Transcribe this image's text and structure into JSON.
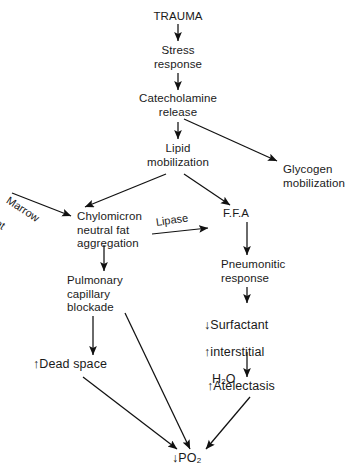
{
  "diagram": {
    "background_color": "#ffffff",
    "text_color": "#1a1a1a",
    "arrow_color": "#111111",
    "nodes": {
      "trauma": "TRAUMA",
      "stress_response": "Stress\nresponse",
      "catecholamine_release": "Catecholamine\nrelease",
      "lipid_mobilization": "Lipid\nmobilization",
      "glycogen_mobilization": "Glycogen\nmobilization",
      "chylomicron": "Chylomicron\nneutral fat\naggregation",
      "ffa": "F.F.A",
      "pulmonary_capillary_blockade": "Pulmonary\ncapillary\nblockade",
      "pneumonitic_response": "Pneumonitic\nresponse",
      "surfactant_line1_arrow": "↓",
      "surfactant_line1_text": "Surfactant",
      "surfactant_line2_arrow": "↑",
      "surfactant_line2_text": "interstitial",
      "surfactant_line3_text": "H",
      "surfactant_line3_sub": "2",
      "surfactant_line3_tail": "O",
      "dead_space_arrow": "↑",
      "dead_space_text": "Dead space",
      "atelectasis_arrow": "↑",
      "atelectasis_text": "Atelectasis",
      "po2_arrow": "↓",
      "po2_text": "PO",
      "po2_sub": "2"
    },
    "edge_labels": {
      "marrow_fat_line1": "Marrow",
      "marrow_fat_line2": "fat",
      "lipase": "Lipase"
    }
  }
}
